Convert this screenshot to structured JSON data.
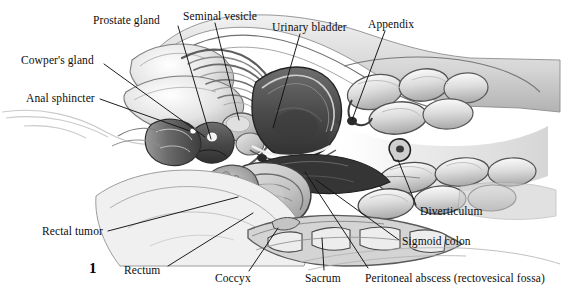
{
  "figure": {
    "number": "1",
    "number_pos": {
      "x": 89,
      "y": 260
    },
    "width": 565,
    "height": 299,
    "background_color": "#ffffff",
    "ink_color": "#0d0d0d",
    "line_color": "#111111"
  },
  "labels": [
    {
      "id": "prostate-gland",
      "text": "Prostate gland",
      "x": 93,
      "y": 14,
      "anchor": "start",
      "leader": [
        [
          178,
          26
        ],
        [
          211,
          139
        ]
      ]
    },
    {
      "id": "seminal-vesicle",
      "text": "Seminal vesicle",
      "x": 183,
      "y": 10,
      "anchor": "start",
      "leader": [
        [
          215,
          23
        ],
        [
          239,
          120
        ]
      ]
    },
    {
      "id": "urinary-bladder",
      "text": "Urinary bladder",
      "x": 272,
      "y": 21,
      "anchor": "start",
      "leader": [
        [
          300,
          34
        ],
        [
          273,
          128
        ]
      ]
    },
    {
      "id": "appendix",
      "text": "Appendix",
      "x": 368,
      "y": 18,
      "anchor": "start",
      "leader": [
        [
          385,
          31
        ],
        [
          352,
          120
        ]
      ]
    },
    {
      "id": "cowpers-gland",
      "text": "Cowper's gland",
      "x": 21,
      "y": 54,
      "anchor": "start",
      "leader": [
        [
          104,
          64
        ],
        [
          205,
          137
        ]
      ]
    },
    {
      "id": "anal-sphincter",
      "text": "Anal sphincter",
      "x": 26,
      "y": 92,
      "anchor": "start",
      "leader": [
        [
          100,
          99
        ],
        [
          190,
          131
        ]
      ]
    },
    {
      "id": "diverticulum",
      "text": "Diverticulum",
      "x": 420,
      "y": 205,
      "anchor": "start",
      "leader": [
        [
          416,
          205
        ],
        [
          398,
          160
        ]
      ]
    },
    {
      "id": "sigmoid-colon",
      "text": "Sigmoid colon",
      "x": 402,
      "y": 235,
      "anchor": "start",
      "leader": [
        [
          399,
          240
        ],
        [
          316,
          180
        ]
      ]
    },
    {
      "id": "rectal-tumor",
      "text": "Rectal tumor",
      "x": 42,
      "y": 225,
      "anchor": "start",
      "leader": [
        [
          108,
          231
        ],
        [
          238,
          197
        ]
      ]
    },
    {
      "id": "rectum",
      "text": "Rectum",
      "x": 124,
      "y": 264,
      "anchor": "start",
      "leader": [
        [
          168,
          266
        ],
        [
          253,
          213
        ]
      ]
    },
    {
      "id": "coccyx",
      "text": "Coccyx",
      "x": 215,
      "y": 272,
      "anchor": "start",
      "leader": [
        [
          249,
          271
        ],
        [
          278,
          228
        ]
      ]
    },
    {
      "id": "sacrum",
      "text": "Sacrum",
      "x": 305,
      "y": 272,
      "anchor": "start",
      "leader": [
        [
          324,
          270
        ],
        [
          322,
          238
        ]
      ]
    },
    {
      "id": "peritoneal-abscess",
      "text": "Peritoneal abscess (rectovesical fossa)",
      "x": 365,
      "y": 272,
      "anchor": "start",
      "leader": [
        [
          368,
          268
        ],
        [
          305,
          172
        ]
      ]
    }
  ]
}
